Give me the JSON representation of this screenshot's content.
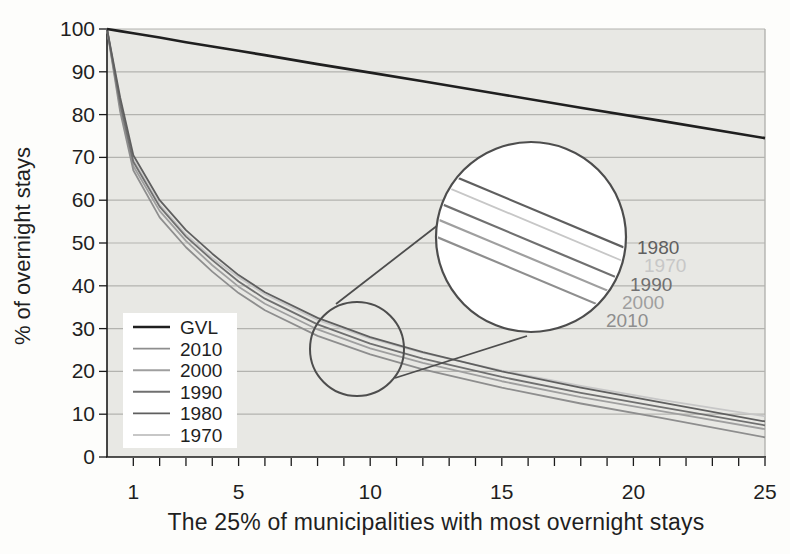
{
  "figure": {
    "x_axis_title": "The 25% of municipalities with most overnight stays",
    "y_axis_title": "% of overnight stays"
  },
  "chart_data": {
    "type": "line",
    "title": "",
    "xlabel": "The 25% of municipalities with most overnight stays",
    "ylabel": "% of overnight stays",
    "xlim": [
      0,
      25
    ],
    "ylim": [
      0,
      100
    ],
    "x_major_ticks": [
      1,
      5,
      10,
      15,
      20,
      25
    ],
    "x_minor_tick_step": 1,
    "y_ticks": [
      0,
      10,
      20,
      30,
      40,
      50,
      60,
      70,
      80,
      90,
      100
    ],
    "grid": "horizontal",
    "legend_position": "lower-left",
    "legend_order": [
      "GVL",
      "2010",
      "2000",
      "1990",
      "1980",
      "1970"
    ],
    "x": [
      0,
      0.5,
      1,
      2,
      3,
      4,
      5,
      6,
      8,
      10,
      12,
      15,
      18,
      21,
      25
    ],
    "series": [
      {
        "name": "GVL",
        "color": "#1f1f1f",
        "width": 2.6,
        "values": [
          100,
          99.5,
          99,
          98,
          96.9,
          95.9,
          94.9,
          93.9,
          91.8,
          89.8,
          87.8,
          84.7,
          81.6,
          78.6,
          74.5
        ]
      },
      {
        "name": "2010",
        "color": "#8e8e8e",
        "width": 1.8,
        "values": [
          100,
          80.7,
          67,
          56,
          49,
          43.3,
          38.3,
          34.3,
          28.3,
          24,
          20.5,
          16.2,
          12.5,
          9.2,
          4.6
        ]
      },
      {
        "name": "2000",
        "color": "#9f9f9f",
        "width": 1.8,
        "values": [
          100,
          81.7,
          68,
          57.5,
          50.5,
          44.8,
          39.8,
          35.8,
          29.8,
          25.4,
          22,
          17.7,
          14,
          10.8,
          6.5
        ]
      },
      {
        "name": "1990",
        "color": "#707070",
        "width": 1.8,
        "values": [
          100,
          82.6,
          69,
          58.5,
          51.5,
          46,
          41,
          37,
          31,
          26.5,
          23,
          18.7,
          15,
          11.7,
          7.4
        ]
      },
      {
        "name": "1980",
        "color": "#5f5f5f",
        "width": 1.8,
        "values": [
          100,
          84,
          70.5,
          60,
          53,
          47.5,
          42.5,
          38.5,
          32.5,
          28,
          24.5,
          20,
          16.2,
          12.8,
          8.3
        ]
      },
      {
        "name": "1970",
        "color": "#c7c7c7",
        "width": 1.7,
        "values": [
          100,
          83.3,
          69.5,
          59,
          52,
          46.5,
          42,
          38,
          32,
          27.7,
          24.3,
          20.2,
          16.6,
          13.4,
          9.5
        ]
      }
    ],
    "draw_order": [
      "1970",
      "2000",
      "2010",
      "1990",
      "1980",
      "GVL"
    ],
    "magnifier_inset": {
      "zoomed_region_center_x": 9.5,
      "zoomed_region_center_y": 25,
      "labels": [
        "1980",
        "1970",
        "1990",
        "2000",
        "2010"
      ]
    },
    "colors": {
      "plot_background": "#e8e8e4",
      "gridline": "#b3b3af",
      "axis": "#1a1a1a",
      "text": "#1f1f1f",
      "lens_stroke": "#4d4d4d",
      "lens_fill": "#ffffff",
      "legend_background": "#ffffff"
    }
  }
}
